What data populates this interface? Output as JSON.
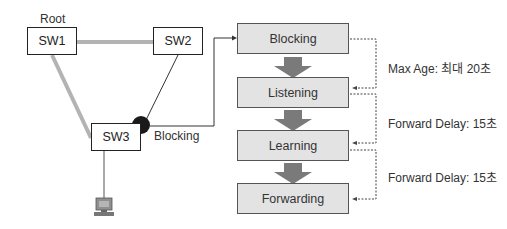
{
  "topology": {
    "root_label": "Root",
    "switches": [
      {
        "id": "sw1",
        "label": "SW1"
      },
      {
        "id": "sw2",
        "label": "SW2"
      },
      {
        "id": "sw3",
        "label": "SW3"
      }
    ],
    "blocking_port_label": "Blocking",
    "pc_icon": "desktop-computer-icon"
  },
  "states": [
    {
      "label": "Blocking"
    },
    {
      "label": "Listening"
    },
    {
      "label": "Learning"
    },
    {
      "label": "Forwarding"
    }
  ],
  "timers": [
    {
      "label": "Max Age: 최대 20초"
    },
    {
      "label": "Forward Delay: 15초"
    },
    {
      "label": "Forward Delay: 15초"
    }
  ],
  "colors": {
    "link_thick": "#b3b3b3",
    "state_fill": "#e3e3e3",
    "arrow_fill": "#7a7a7a",
    "blocking_port": "#1a1a1a"
  }
}
